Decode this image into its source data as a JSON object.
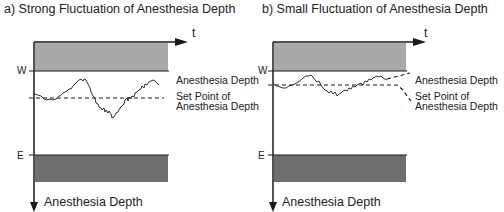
{
  "panels": [
    {
      "title": "a) Strong Fluctuation of Anesthesia Depth",
      "time_label": "t",
      "upper_limit_label": "W",
      "lower_limit_label": "E",
      "depth_curve_label": "Anesthesia Depth",
      "set_point_label_line1": "Set Point of",
      "set_point_label_line2": "Anesthesia Depth",
      "vertical_axis_label": "Anesthesia Depth"
    },
    {
      "title": "b) Small Fluctuation of Anesthesia Depth",
      "time_label": "t",
      "upper_limit_label": "W",
      "lower_limit_label": "E",
      "depth_curve_label": "Anesthesia Depth",
      "set_point_label_line1": "Set Point of",
      "set_point_label_line2": "Anesthesia Depth",
      "vertical_axis_label": "Anesthesia Depth"
    }
  ],
  "colors": {
    "upper_band": "#a9a9a9",
    "lower_band": "#6e6e6e",
    "lines": "#1a1a1a"
  }
}
